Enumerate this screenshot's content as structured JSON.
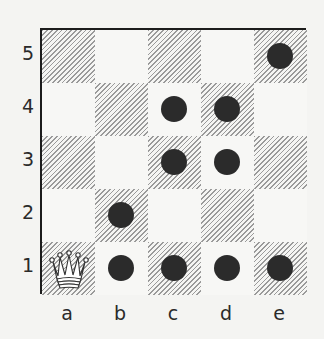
{
  "board": {
    "files": [
      "a",
      "b",
      "c",
      "d",
      "e"
    ],
    "ranks": [
      "5",
      "4",
      "3",
      "2",
      "1"
    ],
    "dark_square_rule": "a1 is dark (hatched); square dark when file_index+rank_index is even",
    "pieces": [
      {
        "square": "a1",
        "type": "queen",
        "color": "white",
        "icon": "queen-icon"
      }
    ],
    "markers": [
      "b1",
      "c1",
      "d1",
      "e1",
      "b2",
      "c3",
      "d3",
      "c4",
      "d4",
      "e5"
    ],
    "colors": {
      "marker": "#2b2b2b",
      "hatch": "#9a9a9a",
      "border": "#1c1c1c",
      "background": "#f4f4f2"
    }
  }
}
